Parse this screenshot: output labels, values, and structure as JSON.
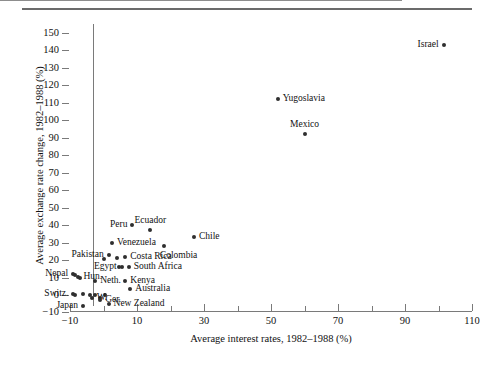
{
  "chart_data": {
    "type": "scatter",
    "title": "",
    "xlabel": "Average interest rates, 1982–1988 (%)",
    "ylabel": "Average exchange rate change, 1982–1988 (%)",
    "xlim": [
      -10,
      110
    ],
    "ylim": [
      -10,
      150
    ],
    "xticks": [
      -10,
      10,
      30,
      50,
      70,
      90,
      110
    ],
    "xticks_minor": [
      0,
      20,
      40,
      60,
      80,
      100
    ],
    "yticks": [
      -10,
      0,
      10,
      20,
      30,
      40,
      50,
      60,
      70,
      80,
      90,
      100,
      110,
      120,
      130,
      140,
      150
    ],
    "grid": false,
    "legend": null,
    "zero_reference_line_y": 0,
    "points": [
      {
        "label": "Israel",
        "x": 101.5,
        "y": 143,
        "label_pos": "left"
      },
      {
        "label": "Yugoslavia",
        "x": 52,
        "y": 112,
        "label_pos": "right"
      },
      {
        "label": "Mexico",
        "x": 60,
        "y": 92,
        "label_pos": "above"
      },
      {
        "label": "Peru",
        "x": 8.5,
        "y": 40,
        "label_pos": "left"
      },
      {
        "label": "Ecuador",
        "x": 14,
        "y": 37,
        "label_pos": "above"
      },
      {
        "label": "Chile",
        "x": 27,
        "y": 33,
        "label_pos": "right"
      },
      {
        "label": "Venezuela",
        "x": 2.5,
        "y": 29.5,
        "label_pos": "right"
      },
      {
        "label": "Colombia",
        "x": 18,
        "y": 28,
        "label_pos": "below-right"
      },
      {
        "label": "Pakistan",
        "x": 1.5,
        "y": 23,
        "label_pos": "left"
      },
      {
        "label": "Costa Rica",
        "x": 6.5,
        "y": 22,
        "label_pos": "right"
      },
      {
        "label": "South Africa",
        "x": 7.5,
        "y": 16,
        "label_pos": "right"
      },
      {
        "label": "Egypt",
        "x": 5.5,
        "y": 16,
        "label_pos": "left"
      },
      {
        "label": "Nepal",
        "x": -9,
        "y": 12,
        "label_pos": "left"
      },
      {
        "label": "Hun.",
        "x": -7.5,
        "y": 10.5,
        "label_pos": "right"
      },
      {
        "label": "Neth.",
        "x": -2.5,
        "y": 8,
        "label_pos": "right"
      },
      {
        "label": "Kenya",
        "x": 6.5,
        "y": 8,
        "label_pos": "right"
      },
      {
        "label": "Australia",
        "x": 8,
        "y": 3.5,
        "label_pos": "right"
      },
      {
        "label": "Switz.",
        "x": -9,
        "y": 0.5,
        "label_pos": "left"
      },
      {
        "label": "W.",
        "x": -3.5,
        "y": -1.5,
        "label_pos": "right"
      },
      {
        "label": "Ger.",
        "x": -1,
        "y": -3,
        "label_pos": "right"
      },
      {
        "label": "Japan",
        "x": -6,
        "y": -6.5,
        "label_pos": "left"
      },
      {
        "label": "New Zealand",
        "x": 1.5,
        "y": -5,
        "label_pos": "right"
      }
    ],
    "unlabeled_points": [
      {
        "x": -8.5,
        "y": 11.5
      },
      {
        "x": -7,
        "y": 9.5
      },
      {
        "x": -6,
        "y": 0.5
      },
      {
        "x": -4,
        "y": 0
      },
      {
        "x": -2.5,
        "y": 0
      },
      {
        "x": -1,
        "y": -1.5
      },
      {
        "x": 0.5,
        "y": 0
      },
      {
        "x": -8.5,
        "y": 0
      },
      {
        "x": 0,
        "y": 20.5
      },
      {
        "x": 4,
        "y": 21
      },
      {
        "x": 4.5,
        "y": 16
      }
    ]
  }
}
